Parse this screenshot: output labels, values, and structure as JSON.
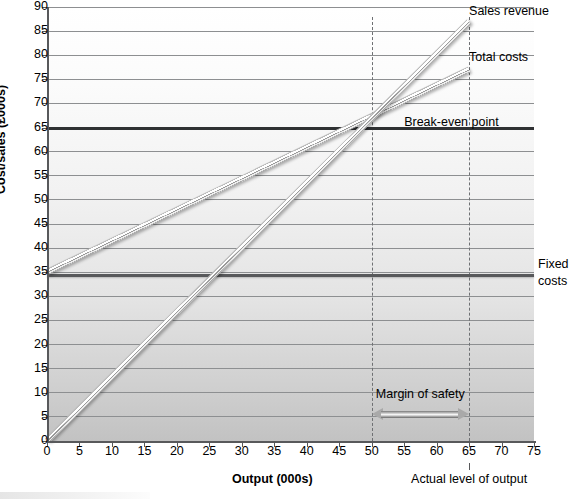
{
  "chart_data": {
    "type": "line",
    "title": "",
    "xlabel": "Output (000s)",
    "ylabel": "Cost/sales (£000s)",
    "xlim": [
      0,
      75
    ],
    "ylim": [
      0,
      90
    ],
    "xticks": [
      0,
      5,
      10,
      15,
      20,
      25,
      30,
      35,
      40,
      45,
      50,
      55,
      60,
      65,
      70,
      75
    ],
    "yticks": [
      0,
      5,
      10,
      15,
      20,
      25,
      30,
      35,
      40,
      45,
      50,
      55,
      60,
      65,
      70,
      75,
      80,
      85,
      90
    ],
    "grid": true,
    "legend_position": "inline-right",
    "series": [
      {
        "name": "Sales revenue",
        "type": "line",
        "x": [
          0,
          65
        ],
        "y": [
          0,
          87
        ]
      },
      {
        "name": "Total costs",
        "type": "line",
        "x": [
          0,
          65
        ],
        "y": [
          35,
          77
        ]
      },
      {
        "name": "Fixed costs",
        "type": "hline",
        "x": [
          0,
          75
        ],
        "y": [
          34.5,
          34.5
        ]
      },
      {
        "name": "Break-even point",
        "type": "hline",
        "x": [
          0,
          75
        ],
        "y": [
          65,
          65
        ]
      }
    ],
    "annotations": [
      {
        "label": "Sales revenue",
        "x": 65,
        "y": 89
      },
      {
        "label": "Total costs",
        "x": 65,
        "y": 79.5
      },
      {
        "label": "Break-even point",
        "x": 55,
        "y": 66
      },
      {
        "label": "Fixed costs",
        "x": 75,
        "y": 35
      },
      {
        "label": "Margin of safety",
        "x": 57.5,
        "y": 9.5
      },
      {
        "label": "Actual level of output",
        "x": 65,
        "y": -7
      }
    ],
    "markers": [
      {
        "label": "break-even output",
        "x": 50,
        "y": 65
      },
      {
        "label": "actual output",
        "x": 65,
        "y": 87
      }
    ]
  },
  "labels": {
    "y_axis_title": "Cost/sales (£000s)",
    "x_axis_title": "Output (000s)",
    "sales_revenue": "Sales revenue",
    "total_costs": "Total costs",
    "fixed_costs_line1": "Fixed",
    "fixed_costs_line2": "costs",
    "break_even_point": "Break-even point",
    "margin_of_safety": "Margin of safety",
    "actual_level_of_output": "Actual level of output"
  },
  "colors": {
    "axis": "#58595b",
    "gridline": "#8d8f91",
    "gridline_major": "#4b4d4f",
    "fixed_costs_line": "#58595b",
    "break_even_line": "#2f3133",
    "dashed_marker": "#6e7073",
    "series_line": "#b9b9b9",
    "text": "#000000"
  }
}
